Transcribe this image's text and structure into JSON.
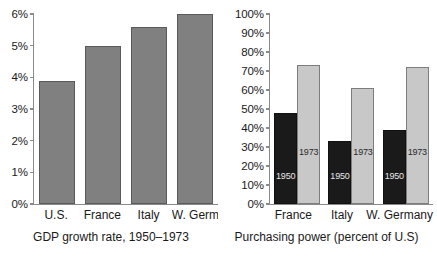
{
  "chart_data": [
    {
      "type": "bar",
      "title": "GDP growth rate, 1950-1973",
      "caption": "GDP growth rate, 1950–1973",
      "xlabel": "",
      "ylabel": "",
      "ylim": [
        0,
        6
      ],
      "ytick_labels": [
        "6%",
        "5%",
        "4%",
        "3%",
        "2%",
        "1%",
        "0%"
      ],
      "ytick_values": [
        6,
        5,
        4,
        3,
        2,
        1,
        0
      ],
      "grid": false,
      "legend": "none",
      "categories": [
        "U.S.",
        "France",
        "Italy",
        "W. Germany"
      ],
      "values": [
        3.9,
        5.0,
        5.6,
        6.0
      ],
      "series": [
        {
          "name": "GDP growth rate",
          "values": [
            3.9,
            5.0,
            5.6,
            6.0
          ],
          "color": "#808080"
        }
      ],
      "bars": [
        {
          "category": "U.S.",
          "value": 3.9,
          "color": "#808080"
        },
        {
          "category": "France",
          "value": 5.0,
          "color": "#808080"
        },
        {
          "category": "Italy",
          "value": 5.6,
          "color": "#808080"
        },
        {
          "category": "W. Germany",
          "value": 6.0,
          "color": "#808080"
        }
      ]
    },
    {
      "type": "bar",
      "title": "Purchasing power (percent of U.S)",
      "caption": "Purchasing power (percent of U.S)",
      "xlabel": "",
      "ylabel": "",
      "ylim": [
        0,
        100
      ],
      "ytick_labels": [
        "100%",
        "90%",
        "80%",
        "70%",
        "60%",
        "50%",
        "40%",
        "30%",
        "20%",
        "10%",
        "0%"
      ],
      "ytick_values": [
        100,
        90,
        80,
        70,
        60,
        50,
        40,
        30,
        20,
        10,
        0
      ],
      "grid": false,
      "legend": "in-bar labels",
      "categories": [
        "France",
        "Italy",
        "W. Germany"
      ],
      "series": [
        {
          "name": "1950",
          "values": [
            48,
            33,
            39
          ],
          "color": "#1a1a1a"
        },
        {
          "name": "1973",
          "values": [
            73,
            61,
            72
          ],
          "color": "#c8c8c8"
        }
      ],
      "groups": [
        {
          "category": "France",
          "bars": [
            {
              "label": "1950",
              "value": 48,
              "color": "#1a1a1a"
            },
            {
              "label": "1973",
              "value": 73,
              "color": "#c8c8c8"
            }
          ]
        },
        {
          "category": "Italy",
          "bars": [
            {
              "label": "1950",
              "value": 33,
              "color": "#1a1a1a"
            },
            {
              "label": "1973",
              "value": 61,
              "color": "#c8c8c8"
            }
          ]
        },
        {
          "category": "W. Germany",
          "bars": [
            {
              "label": "1950",
              "value": 39,
              "color": "#1a1a1a"
            },
            {
              "label": "1973",
              "value": 72,
              "color": "#c8c8c8"
            }
          ]
        }
      ]
    }
  ],
  "colors": {
    "background": "#ffffff",
    "axis": "#8a8a8a",
    "text": "#1a1a1a",
    "bar_gray": "#808080",
    "bar_dark": "#1a1a1a",
    "bar_light": "#c8c8c8"
  }
}
